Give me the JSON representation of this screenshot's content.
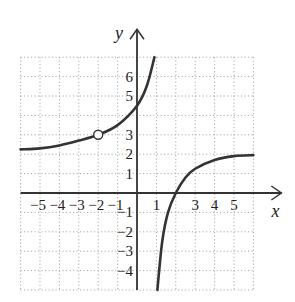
{
  "chart_data": {
    "type": "line",
    "title": "",
    "xlabel": "x",
    "ylabel": "y",
    "xlim": [
      -6,
      6
    ],
    "ylim": [
      -5,
      7
    ],
    "grid": true,
    "x_tick_labels": [
      "-5",
      "-4",
      "-3",
      "-2",
      "-1",
      "1",
      "3",
      "4",
      "5"
    ],
    "y_tick_labels": [
      "6",
      "5",
      "3",
      "2",
      "1",
      "-1",
      "-2",
      "-3",
      "-4"
    ],
    "vertical_asymptote": 1,
    "series": [
      {
        "name": "left branch",
        "points": [
          [
            -6,
            2.25
          ],
          [
            -5,
            2.3
          ],
          [
            -4,
            2.45
          ],
          [
            -3,
            2.7
          ],
          [
            -2,
            3
          ],
          [
            -1,
            3.5
          ],
          [
            0,
            4.5
          ],
          [
            0.5,
            5.5
          ],
          [
            0.9,
            7
          ]
        ]
      },
      {
        "name": "right branch",
        "points": [
          [
            1.05,
            -5
          ],
          [
            1.3,
            -2.5
          ],
          [
            1.6,
            -1
          ],
          [
            2,
            0
          ],
          [
            2.5,
            0.8
          ],
          [
            3,
            1.25
          ],
          [
            4,
            1.7
          ],
          [
            5,
            1.9
          ],
          [
            6,
            1.95
          ]
        ]
      }
    ],
    "open_points": [
      [
        -2,
        3
      ]
    ],
    "colors": {
      "curve": "#333333",
      "axis": "#333333",
      "grid": "#9a9a9a"
    }
  }
}
